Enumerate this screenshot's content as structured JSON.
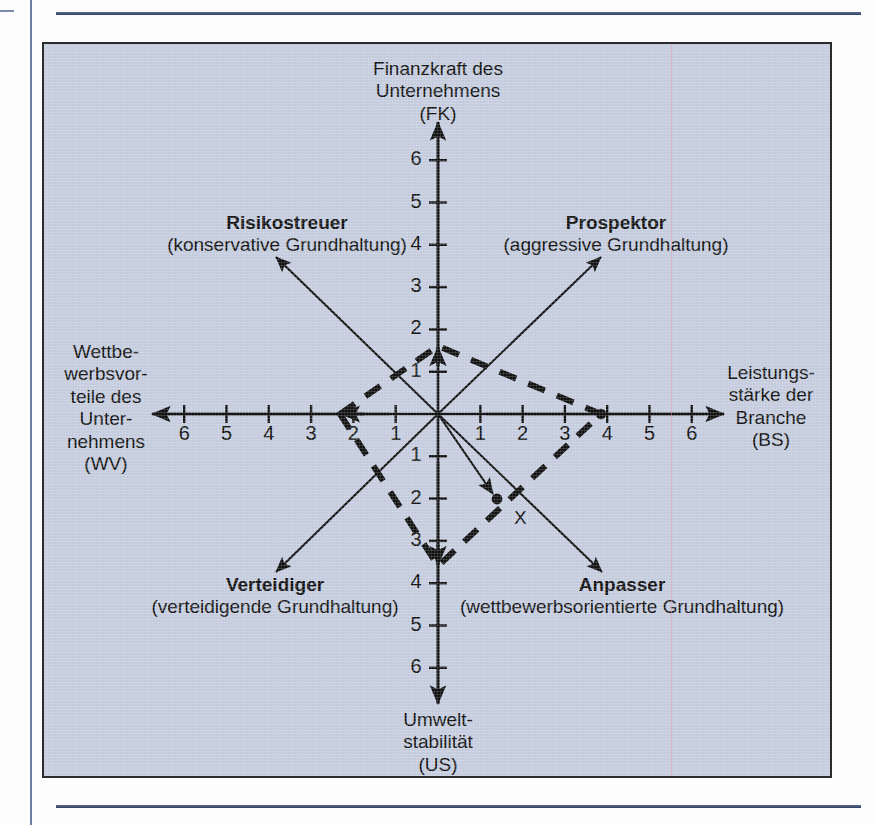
{
  "figure": {
    "background_color": "#c3cbdd",
    "border_color": "#2b2b2b",
    "axis_color": "#101010"
  },
  "axes": {
    "top": {
      "lines": [
        "Finanzkraft des",
        "Unternehmens",
        "(FK)"
      ],
      "code": "FK"
    },
    "bottom": {
      "lines": [
        "Umwelt-",
        "stabilität",
        "(US)"
      ],
      "code": "US"
    },
    "left": {
      "lines": [
        "Wettbe-",
        "werbsvor-",
        "teile des",
        "Unter-",
        "nehmens",
        "(WV)"
      ],
      "code": "WV"
    },
    "right": {
      "lines": [
        "Leistungs-",
        "stärke der",
        "Branche",
        "(BS)"
      ],
      "code": "BS"
    }
  },
  "quadrants": [
    {
      "id": "risikostreuer",
      "name": "Risikostreuer",
      "subtitle": "(konservative Grundhaltung)",
      "position": "top-left"
    },
    {
      "id": "prospektor",
      "name": "Prospektor",
      "subtitle": "(aggressive Grundhaltung)",
      "position": "top-right"
    },
    {
      "id": "verteidiger",
      "name": "Verteidiger",
      "subtitle": "(verteidigende Grundhaltung)",
      "position": "bottom-left"
    },
    {
      "id": "anpasser",
      "name": "Anpasser",
      "subtitle": "(wettbewerbsorientierte Grundhaltung)",
      "position": "bottom-right"
    }
  ],
  "marker": {
    "label": "X"
  },
  "chart_data": {
    "type": "scatter",
    "xlabel": "Wettbewerbsvorteile des Unternehmens (WV)  /  Leistungsstärke der Branche (BS)",
    "ylabel": "Finanzkraft des Unternehmens (FK)  /  Umweltstabilität (US)",
    "xlim": [
      -6,
      6
    ],
    "ylim": [
      -6,
      6
    ],
    "grid": false,
    "legend": "none",
    "x_ticks_left": [
      6,
      5,
      4,
      3,
      2,
      1
    ],
    "x_ticks_right": [
      1,
      2,
      3,
      4,
      5,
      6
    ],
    "y_ticks_up": [
      1,
      2,
      3,
      4,
      5,
      6
    ],
    "y_ticks_down": [
      1,
      2,
      3,
      4,
      5,
      6
    ],
    "axis_values": {
      "FK": 1.6,
      "BS": 3.85,
      "US": -3.6,
      "WV": -2.3
    },
    "polygon": [
      {
        "x": -2.3,
        "y": 0,
        "axis": "WV"
      },
      {
        "x": 0,
        "y": 1.6,
        "axis": "FK"
      },
      {
        "x": 3.85,
        "y": 0,
        "axis": "BS"
      },
      {
        "x": 0,
        "y": -3.6,
        "axis": "US"
      }
    ],
    "resultant_vector": {
      "from": [
        0,
        0
      ],
      "to": [
        1.4,
        -2.0
      ],
      "label": "X"
    },
    "quadrant_arrows": [
      {
        "label": "Risikostreuer",
        "to": [
          -3.8,
          3.7
        ]
      },
      {
        "label": "Prospektor",
        "to": [
          3.7,
          3.7
        ]
      },
      {
        "label": "Verteidiger",
        "to": [
          -3.8,
          -3.8
        ]
      },
      {
        "label": "Anpasser",
        "to": [
          3.8,
          -3.8
        ]
      }
    ]
  }
}
